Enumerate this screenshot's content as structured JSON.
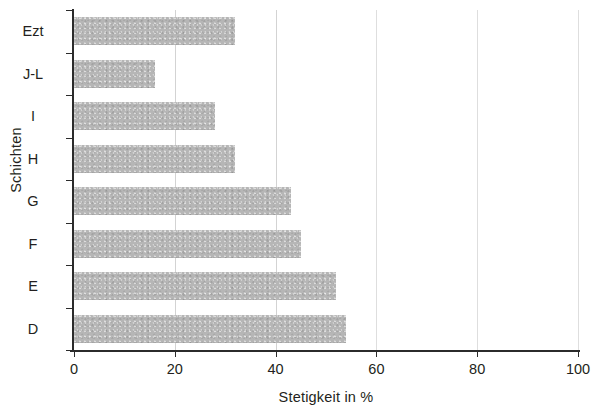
{
  "chart_data": {
    "type": "bar",
    "orientation": "horizontal",
    "title": "",
    "subtitle": "",
    "xlabel": "Stetigkeit in %",
    "ylabel": "Schichten",
    "categories": [
      "D",
      "E",
      "F",
      "G",
      "H",
      "I",
      "J-L",
      "Ezt"
    ],
    "values": [
      54,
      52,
      45,
      43,
      32,
      28,
      16,
      32
    ],
    "series": [
      {
        "name": "Stetigkeit",
        "values": [
          54,
          52,
          45,
          43,
          32,
          28,
          16,
          32
        ]
      }
    ],
    "xlim": [
      0,
      100
    ],
    "xticks": [
      0,
      20,
      40,
      60,
      80,
      100
    ],
    "xtick_labels": [
      "0",
      "20",
      "40",
      "60",
      "80",
      "100"
    ],
    "grid": "vertical",
    "legend": "none",
    "bar_color": "#b6b6b6",
    "axis_color": "#2b2b2b",
    "text_color": "#231f20",
    "background_color": "#ffffff"
  }
}
